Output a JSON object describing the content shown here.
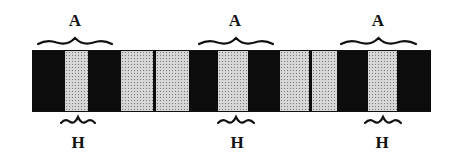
{
  "diagram": {
    "type": "sarcomere band pattern",
    "colors": {
      "dark_band": "#0c0c0c",
      "light_band": "#d6d6d6",
      "ink": "#111111"
    },
    "bar": {
      "x": 32,
      "y": 50,
      "width": 399,
      "height": 62
    },
    "segments": [
      {
        "kind": "dark",
        "x0": 32,
        "x1": 65
      },
      {
        "kind": "light",
        "x0": 65,
        "x1": 88
      },
      {
        "kind": "dark",
        "x0": 88,
        "x1": 121
      },
      {
        "kind": "light",
        "x0": 121,
        "x1": 153
      },
      {
        "kind": "dark",
        "x0": 153,
        "x1": 156
      },
      {
        "kind": "light",
        "x0": 156,
        "x1": 189
      },
      {
        "kind": "dark",
        "x0": 189,
        "x1": 218
      },
      {
        "kind": "light",
        "x0": 218,
        "x1": 248
      },
      {
        "kind": "dark",
        "x0": 248,
        "x1": 280
      },
      {
        "kind": "light",
        "x0": 280,
        "x1": 309
      },
      {
        "kind": "dark",
        "x0": 309,
        "x1": 312
      },
      {
        "kind": "light",
        "x0": 312,
        "x1": 337
      },
      {
        "kind": "dark",
        "x0": 337,
        "x1": 368
      },
      {
        "kind": "light",
        "x0": 368,
        "x1": 397
      },
      {
        "kind": "dark",
        "x0": 397,
        "x1": 431
      }
    ],
    "top_labels": [
      {
        "text": "A",
        "cx": 75,
        "brace_x0": 38,
        "brace_x1": 112
      },
      {
        "text": "A",
        "cx": 235,
        "brace_x0": 199,
        "brace_x1": 273
      },
      {
        "text": "A",
        "cx": 378,
        "brace_x0": 341,
        "brace_x1": 416
      }
    ],
    "bottom_labels": [
      {
        "text": "H",
        "cx": 78,
        "brace_x0": 61,
        "brace_x1": 95
      },
      {
        "text": "H",
        "cx": 237,
        "brace_x0": 218,
        "brace_x1": 254
      },
      {
        "text": "H",
        "cx": 382,
        "brace_x0": 365,
        "brace_x1": 401
      }
    ]
  }
}
